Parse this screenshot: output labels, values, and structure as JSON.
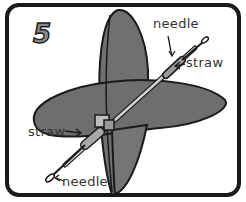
{
  "step": {
    "number": "5"
  },
  "labels": {
    "needle_top": "needle",
    "straw_top": "straw",
    "straw_bottom": "straw",
    "needle_bottom": "needle"
  },
  "colors": {
    "frame": "#1a1a1a",
    "background": "#ffffff",
    "disc_fill": "#6e6e6e",
    "disc_fill_light": "#7a7a7a",
    "straw_fill": "#9a9a9a",
    "number_fill": "#8a8a8a",
    "label_text": "#333333"
  }
}
